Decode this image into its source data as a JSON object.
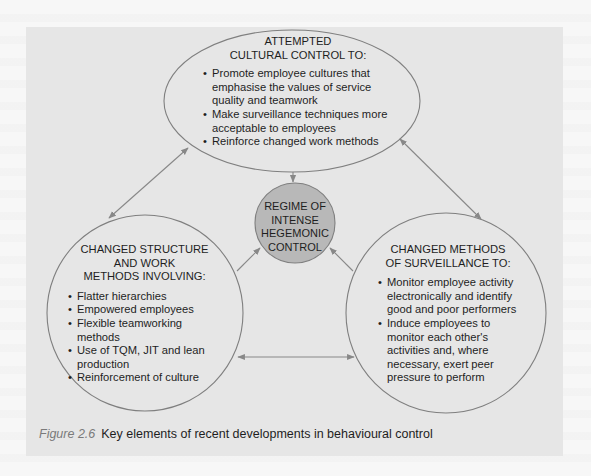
{
  "colors": {
    "page_background": "#f7f7f7",
    "panel_background": "#e6e6e6",
    "outline": "#7f7f7f",
    "center_fill": "#b8b8b8",
    "arrow": "#888888",
    "text": "#1e1e1e",
    "caption_label": "#7a7a7a"
  },
  "nodes": {
    "top": {
      "title_line1": "ATTEMPTED",
      "title_line2": "CULTURAL CONTROL TO:",
      "items": [
        "Promote employee cultures that emphasise the values of service quality and teamwork",
        "Make surveillance techniques more acceptable to employees",
        "Reinforce changed work methods"
      ]
    },
    "left": {
      "title_line1": "CHANGED STRUCTURE",
      "title_line2": "AND WORK",
      "title_line3": "METHODS INVOLVING:",
      "items": [
        "Flatter hierarchies",
        "Empowered employees",
        "Flexible teamworking methods",
        "Use of TQM, JIT and lean production",
        "Reinforcement of culture"
      ]
    },
    "right": {
      "title_line1": "CHANGED METHODS",
      "title_line2": "OF SURVEILLANCE TO:",
      "items": [
        "Monitor employee activity electronically and identify good and poor performers",
        "Induce employees to monitor each other's activities and, where necessary, exert peer pressure to perform"
      ]
    },
    "center": {
      "line1": "REGIME OF",
      "line2": "INTENSE",
      "line3": "HEGEMONIC",
      "line4": "CONTROL"
    }
  },
  "edges": [
    {
      "from": "top",
      "to": "left",
      "type": "double"
    },
    {
      "from": "top",
      "to": "right",
      "type": "double"
    },
    {
      "from": "left",
      "to": "right",
      "type": "double"
    },
    {
      "from": "top",
      "to": "center",
      "type": "single"
    },
    {
      "from": "left",
      "to": "center",
      "type": "single"
    },
    {
      "from": "right",
      "to": "center",
      "type": "single"
    }
  ],
  "caption": {
    "label": "Figure 2.6",
    "text": "Key elements of recent developments in behavioural control"
  }
}
